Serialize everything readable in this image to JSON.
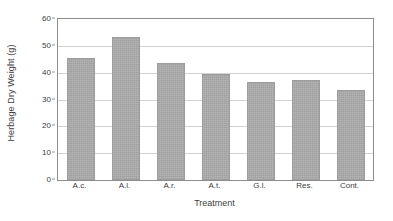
{
  "chart_data": {
    "type": "bar",
    "title": "",
    "subtitle": "",
    "xlabel": "Treatment",
    "ylabel": "Herbage Dry Weight (g)",
    "categories": [
      "A.c.",
      "A.l.",
      "A.r.",
      "A.t.",
      "G.l.",
      "Res.",
      "Cont."
    ],
    "values": [
      45.4,
      53.4,
      43.6,
      39.5,
      36.6,
      37.3,
      33.5
    ],
    "ylim": [
      0,
      60
    ],
    "yticks": [
      0,
      10,
      20,
      30,
      40,
      50,
      60
    ],
    "ytick_labels": [
      "0",
      "10",
      "20",
      "30",
      "40",
      "50",
      "60"
    ],
    "grid": true,
    "grid_axis": "y",
    "legend": false,
    "legend_position": "none",
    "annotations": [],
    "colors": {
      "bar_fill": "#ababab",
      "bar_edge": "#9d9d9d",
      "gridline": "#d2d2d2",
      "frame": "#8d8d8d",
      "text": "#404040",
      "background": "#ffffff"
    }
  }
}
